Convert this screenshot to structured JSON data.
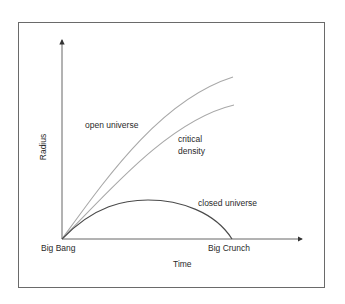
{
  "diagram": {
    "type": "cosmology-expansion-curves",
    "axes": {
      "x_label": "Time",
      "y_label": "Radius",
      "x_origin_label": "Big Bang",
      "x_end_label": "Big Crunch"
    },
    "curves": [
      {
        "id": "open",
        "label": "open universe",
        "color": "#a8a8a8"
      },
      {
        "id": "critical",
        "label_line1": "critical",
        "label_line2": "density",
        "color": "#a8a8a8"
      },
      {
        "id": "closed",
        "label": "closed universe",
        "color": "#4a4a4a"
      }
    ],
    "colors": {
      "axis": "#555555",
      "frame": "#6a6a6a",
      "text": "#2a2a2a",
      "background": "#ffffff"
    }
  }
}
